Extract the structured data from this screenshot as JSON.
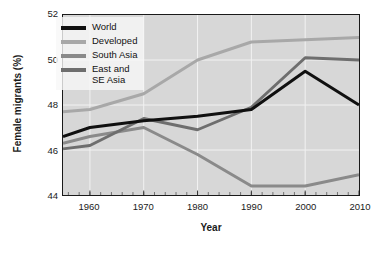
{
  "chart_data": {
    "type": "line",
    "title": "",
    "xlabel": "Year",
    "ylabel": "Female migrants (%)",
    "xlim": [
      1955,
      2010
    ],
    "ylim": [
      44,
      52
    ],
    "yticks": [
      44,
      46,
      48,
      50,
      52
    ],
    "xticks": [
      1960,
      1970,
      1980,
      1990,
      2000,
      2010
    ],
    "xminor_step": 2,
    "grid": true,
    "legend_position": "upper left",
    "x": [
      1955,
      1960,
      1970,
      1980,
      1990,
      2000,
      2010
    ],
    "series": [
      {
        "name": "World",
        "color": "#101010",
        "values": [
          46.6,
          47.0,
          47.3,
          47.5,
          47.8,
          49.5,
          48.0
        ]
      },
      {
        "name": "Developed",
        "color": "#a8a8a8",
        "values": [
          47.7,
          47.8,
          48.5,
          50.0,
          50.8,
          50.9,
          51.0
        ]
      },
      {
        "name": "South Asia",
        "color": "#8a8a8a",
        "values": [
          46.3,
          46.6,
          47.0,
          45.8,
          44.4,
          44.4,
          44.9
        ]
      },
      {
        "name": "East and\nSE Asia",
        "color": "#6e6e6e",
        "values": [
          46.05,
          46.2,
          47.4,
          46.9,
          47.9,
          50.1,
          50.0
        ]
      }
    ]
  },
  "axes": {
    "y_tick_labels": [
      "44",
      "46",
      "48",
      "50",
      "52"
    ],
    "x_tick_labels": [
      "1960",
      "1970",
      "1980",
      "1990",
      "2000",
      "2010"
    ],
    "y_title": "Female migrants (%)",
    "x_title": "Year"
  },
  "legend": {
    "items": [
      {
        "label": "World",
        "color": "#101010"
      },
      {
        "label": "Developed",
        "color": "#a8a8a8"
      },
      {
        "label": "South Asia",
        "color": "#8a8a8a"
      },
      {
        "label": "East and\nSE Asia",
        "color": "#6e6e6e"
      }
    ]
  },
  "style": {
    "plot_background": "#d7d7d7",
    "grid_color": "#f2f2f2",
    "frame_color": "#1a1a1a",
    "page_background": "#ffffff"
  }
}
